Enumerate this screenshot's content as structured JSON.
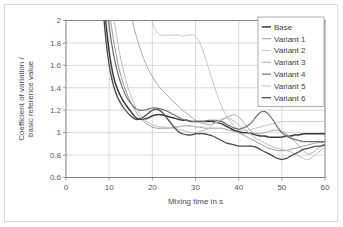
{
  "chart_data": {
    "type": "line",
    "title": "",
    "xlabel": "Mixing time in s",
    "ylabel": "Coefficient of variation / basic reference value",
    "ylabel_line1": "Coefficient of variation /",
    "ylabel_line2": "basic reference value",
    "xlim": [
      0,
      60
    ],
    "ylim": [
      0.6,
      2
    ],
    "xticks": [
      0,
      10,
      20,
      30,
      40,
      50,
      60
    ],
    "yticks": [
      0.6,
      0.8,
      1,
      1.2,
      1.4,
      1.6,
      1.8,
      2
    ],
    "xtick_labels": [
      "0",
      "10",
      "20",
      "30",
      "40",
      "50",
      "60"
    ],
    "ytick_labels": [
      "0.6",
      "0.8",
      "1",
      "1.2",
      "1.4",
      "1.6",
      "1.8",
      "2"
    ],
    "grid": true,
    "grid_color": "#c8c8c8",
    "legend_position": "top-right",
    "x": [
      7,
      8,
      9,
      10,
      11,
      12,
      13,
      14,
      15,
      16,
      17,
      18,
      19,
      20,
      21,
      22,
      23,
      24,
      25,
      26,
      27,
      28,
      29,
      30,
      31,
      32,
      33,
      34,
      35,
      36,
      37,
      38,
      39,
      40,
      41,
      42,
      43,
      44,
      45,
      46,
      47,
      48,
      49,
      50,
      51,
      52,
      53,
      54,
      55,
      56,
      57,
      58,
      59,
      60
    ],
    "series": [
      {
        "name": "Base",
        "color": "#3a3a3a",
        "width": 1.5,
        "values": [
          3.3,
          2.62,
          2.08,
          1.72,
          1.5,
          1.38,
          1.3,
          1.24,
          1.19,
          1.14,
          1.12,
          1.12,
          1.13,
          1.15,
          1.16,
          1.16,
          1.15,
          1.14,
          1.13,
          1.12,
          1.11,
          1.11,
          1.1,
          1.1,
          1.1,
          1.1,
          1.1,
          1.1,
          1.09,
          1.08,
          1.06,
          1.04,
          1.02,
          1.01,
          1.0,
          1.0,
          0.99,
          0.98,
          0.97,
          0.97,
          0.96,
          0.96,
          0.96,
          0.96,
          0.97,
          0.97,
          0.98,
          0.98,
          0.99,
          0.99,
          0.99,
          0.99,
          0.99,
          0.99
        ]
      },
      {
        "name": "Variant 1",
        "color": "#9a9a9a",
        "width": 1.0,
        "values": [
          3.8,
          3.05,
          2.5,
          2.1,
          1.83,
          1.62,
          1.47,
          1.36,
          1.27,
          1.2,
          1.14,
          1.1,
          1.07,
          1.05,
          1.04,
          1.04,
          1.04,
          1.04,
          1.05,
          1.05,
          1.06,
          1.06,
          1.06,
          1.05,
          1.05,
          1.04,
          1.04,
          1.04,
          1.04,
          1.04,
          1.03,
          1.02,
          1.01,
          1.0,
          0.98,
          0.96,
          0.94,
          0.92,
          0.9,
          0.88,
          0.86,
          0.85,
          0.84,
          0.84,
          0.84,
          0.85,
          0.86,
          0.87,
          0.88,
          0.89,
          0.9,
          0.91,
          0.91,
          0.92
        ]
      },
      {
        "name": "Variant 2",
        "color": "#c4c4c4",
        "width": 1.0,
        "values": [
          5.5,
          5.0,
          4.55,
          4.15,
          3.8,
          3.48,
          3.2,
          2.95,
          2.72,
          2.52,
          2.35,
          2.2,
          2.08,
          1.98,
          1.9,
          1.87,
          1.87,
          1.87,
          1.87,
          1.87,
          1.86,
          1.87,
          1.87,
          1.86,
          1.8,
          1.7,
          1.58,
          1.46,
          1.34,
          1.24,
          1.16,
          1.1,
          1.06,
          1.03,
          1.02,
          1.02,
          1.03,
          1.04,
          1.05,
          1.06,
          1.07,
          1.08,
          1.09,
          1.1,
          1.1,
          1.1,
          1.1,
          1.1,
          1.1,
          1.1,
          1.1,
          1.1,
          1.1,
          1.1
        ]
      },
      {
        "name": "Variant 3",
        "color": "#a8a8a8",
        "width": 1.0,
        "values": [
          5.0,
          4.4,
          3.9,
          3.45,
          3.08,
          2.76,
          2.48,
          2.25,
          2.06,
          1.9,
          1.77,
          1.66,
          1.57,
          1.5,
          1.44,
          1.39,
          1.35,
          1.31,
          1.27,
          1.24,
          1.2,
          1.17,
          1.14,
          1.11,
          1.09,
          1.08,
          1.07,
          1.08,
          1.09,
          1.11,
          1.13,
          1.15,
          1.16,
          1.14,
          1.1,
          1.05,
          1.01,
          0.99,
          0.99,
          1.0,
          1.01,
          1.02,
          1.02,
          1.01,
          0.99,
          0.96,
          0.92,
          0.88,
          0.84,
          0.81,
          0.82,
          0.85,
          0.88,
          0.9
        ]
      },
      {
        "name": "Variant 4",
        "color": "#6e6e6e",
        "width": 1.2,
        "values": [
          3.55,
          2.85,
          2.32,
          1.95,
          1.7,
          1.53,
          1.41,
          1.32,
          1.26,
          1.22,
          1.2,
          1.2,
          1.21,
          1.22,
          1.22,
          1.21,
          1.2,
          1.18,
          1.16,
          1.14,
          1.12,
          1.11,
          1.1,
          1.1,
          1.1,
          1.1,
          1.11,
          1.11,
          1.11,
          1.1,
          1.08,
          1.06,
          1.04,
          1.03,
          1.04,
          1.06,
          1.09,
          1.14,
          1.18,
          1.19,
          1.16,
          1.11,
          1.05,
          1.0,
          0.97,
          0.95,
          0.94,
          0.93,
          0.92,
          0.92,
          0.92,
          0.92,
          0.92,
          0.92
        ]
      },
      {
        "name": "Variant 5",
        "color": "#bdbdbd",
        "width": 1.0,
        "values": [
          4.2,
          3.45,
          2.85,
          2.4,
          2.05,
          1.8,
          1.6,
          1.45,
          1.33,
          1.24,
          1.17,
          1.12,
          1.09,
          1.07,
          1.06,
          1.05,
          1.05,
          1.04,
          1.04,
          1.03,
          1.02,
          1.01,
          1.0,
          1.0,
          1.01,
          1.02,
          1.04,
          1.07,
          1.1,
          1.12,
          1.13,
          1.12,
          1.1,
          1.07,
          1.04,
          1.01,
          0.98,
          0.95,
          0.93,
          0.91,
          0.89,
          0.87,
          0.86,
          0.85,
          0.84,
          0.83,
          0.81,
          0.79,
          0.77,
          0.76,
          0.78,
          0.81,
          0.84,
          0.86
        ]
      },
      {
        "name": "Variant 6",
        "color": "#4a4a4a",
        "width": 1.3,
        "values": [
          3.1,
          2.42,
          1.92,
          1.6,
          1.42,
          1.31,
          1.24,
          1.19,
          1.15,
          1.12,
          1.12,
          1.14,
          1.17,
          1.2,
          1.21,
          1.19,
          1.15,
          1.1,
          1.05,
          1.01,
          0.99,
          0.98,
          0.98,
          0.99,
          0.99,
          0.99,
          0.98,
          0.97,
          0.95,
          0.93,
          0.91,
          0.9,
          0.89,
          0.88,
          0.88,
          0.88,
          0.88,
          0.87,
          0.85,
          0.83,
          0.81,
          0.79,
          0.77,
          0.76,
          0.77,
          0.79,
          0.81,
          0.83,
          0.85,
          0.86,
          0.87,
          0.88,
          0.88,
          0.89
        ]
      }
    ]
  }
}
